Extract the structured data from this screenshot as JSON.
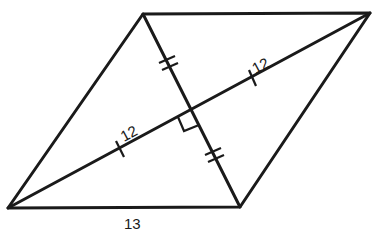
{
  "diagram": {
    "shape": "rhombus",
    "vertices": {
      "top_left": [
        143,
        14
      ],
      "top_right": [
        370,
        13
      ],
      "bottom_right": [
        240,
        207
      ],
      "bottom_left": [
        8,
        208
      ]
    },
    "intersection": [
      191,
      110
    ],
    "labels": {
      "upper_half_diagonal": "12",
      "lower_half_diagonal": "12",
      "bottom_side": "13"
    },
    "marks": {
      "long_diagonal_halves": "single tick",
      "short_diagonal_halves": "double tick",
      "right_angle_at_intersection": true
    },
    "stroke_color": "#1a1a1a"
  }
}
